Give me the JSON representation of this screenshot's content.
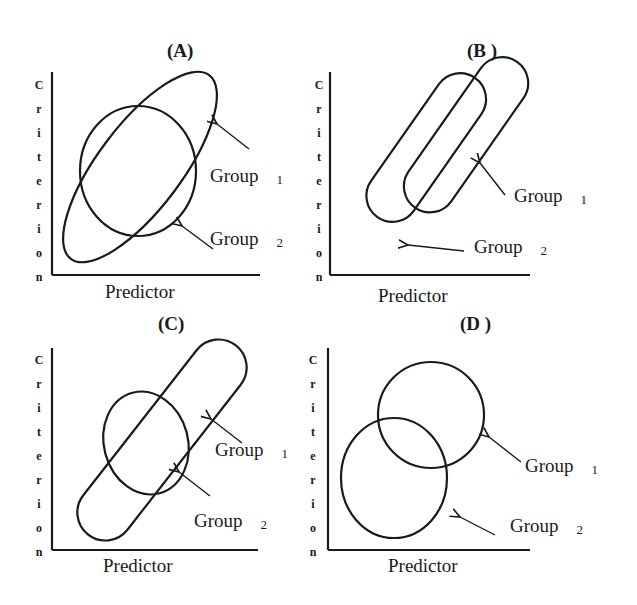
{
  "figure": {
    "panels": [
      {
        "id": "A",
        "title": "(A)",
        "ylabel": "Criterion",
        "xlabel": "Predictor",
        "groups": [
          {
            "label": "Group",
            "num": "1"
          },
          {
            "label": "Group",
            "num": "2"
          }
        ],
        "description": "Group 1 elongated ellipse (high correlation) overlapping Group 2 circle (low correlation), similar centers"
      },
      {
        "id": "B",
        "title": "(B )",
        "ylabel": "Criterion",
        "xlabel": "Predictor",
        "groups": [
          {
            "label": "Group",
            "num": "1"
          },
          {
            "label": "Group",
            "num": "2"
          }
        ],
        "description": "Two parallel elongated ellipses, Group 1 shifted right"
      },
      {
        "id": "C",
        "title": "(C)",
        "ylabel": "Criterion",
        "xlabel": "Predictor",
        "groups": [
          {
            "label": "Group",
            "num": "1"
          },
          {
            "label": "Group",
            "num": "2"
          }
        ],
        "description": "Group 2 smaller ellipse inside larger Group 1 elongated ellipse"
      },
      {
        "id": "D",
        "title": "(D )",
        "ylabel": "Criterion",
        "xlabel": "Predictor",
        "groups": [
          {
            "label": "Group",
            "num": "1"
          },
          {
            "label": "Group",
            "num": "2"
          }
        ],
        "description": "Two circles, Group 1 upper-right, Group 2 lower-left, partially overlapping"
      }
    ],
    "ylabel_letters": [
      "C",
      "r",
      "i",
      "t",
      "e",
      "r",
      "i",
      "o",
      "n"
    ]
  },
  "colors": {
    "stroke": "#1a1a1a",
    "background": "#ffffff"
  }
}
